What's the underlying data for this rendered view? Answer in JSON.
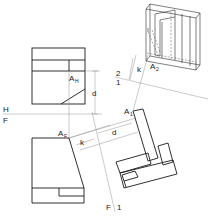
{
  "figure": {
    "type": "descriptive-geometry-auxiliary-views",
    "views": [
      "top-view",
      "front-view",
      "auxiliary-view-1",
      "auxiliary-view-2"
    ],
    "fold_lines": {
      "h_f": {
        "upper": "H",
        "lower": "F"
      },
      "f_1": {
        "left": "F",
        "right": "1"
      },
      "one_two": {
        "upper": "2",
        "lower": "1"
      }
    },
    "points": {
      "a_h": {
        "main": "A",
        "sub": "H"
      },
      "a_f": {
        "main": "A",
        "sub": "F"
      },
      "a_1": {
        "main": "A",
        "sub": "1"
      },
      "a_2": {
        "main": "A",
        "sub": "2"
      }
    },
    "dimensions": {
      "d_top": "d",
      "d_aux": "d",
      "k_front": "k",
      "k_aux2": "k"
    }
  }
}
